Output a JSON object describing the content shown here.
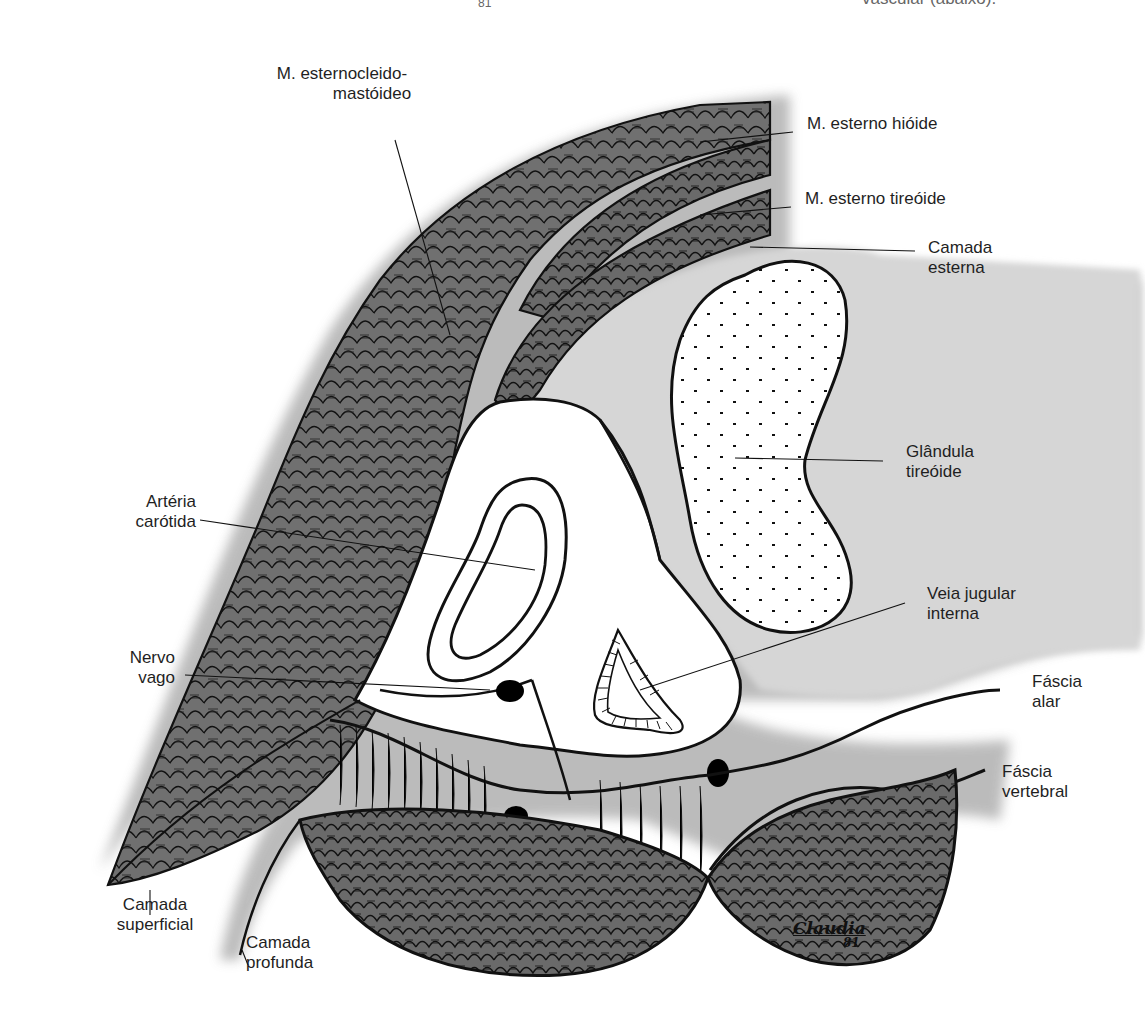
{
  "figure": {
    "top_cropped_text": "vascular (abaixo).",
    "top_cropped_signature_year": "81",
    "signature": "Claudia",
    "signature_year": "81"
  },
  "labels": {
    "scm_line1": "M. esternocleido-",
    "scm_line2": "mastóideo",
    "sternohyoid": "M. esterno hióide",
    "sternothyroid": "M. esterno tireóide",
    "external_layer_1": "Camada",
    "external_layer_2": "esterna",
    "thyroid_1": "Glândula",
    "thyroid_2": "tireóide",
    "carotid_1": "Artéria",
    "carotid_2": "carótida",
    "jugular_1": "Veia jugular",
    "jugular_2": "interna",
    "vagus_1": "Nervo",
    "vagus_2": "vago",
    "alar_1": "Fáscia",
    "alar_2": "alar",
    "vertebral_1": "Fáscia",
    "vertebral_2": "vertebral",
    "superficial_1": "Camada",
    "superficial_2": "superficial",
    "deep_1": "Camada",
    "deep_2": "profunda"
  },
  "colors": {
    "ink": "#111111",
    "muscle": "#6e6e6e",
    "fascia_shadow": "#9a9a9a",
    "light_fill": "#d9d9d9"
  }
}
